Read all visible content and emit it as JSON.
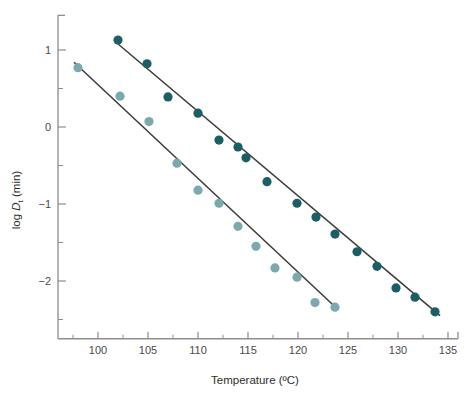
{
  "chart_data": {
    "type": "scatter",
    "title": "",
    "xlabel": "Temperature (ºC)",
    "ylabel": "log Dt (min)",
    "ylabel_parts": {
      "prefix": "log ",
      "italic": "D",
      "subscript": "t",
      "suffix": " (min)"
    },
    "xlim": [
      96,
      136
    ],
    "ylim": [
      -2.75,
      1.45
    ],
    "xticks": [
      100,
      105,
      110,
      115,
      120,
      125,
      130,
      135
    ],
    "xtick_labels": [
      "100",
      "105",
      "110",
      "115",
      "120",
      "125",
      "130",
      "135"
    ],
    "xminor_ticks": [
      97.5,
      102.5,
      107.5,
      112.5,
      117.5,
      122.5,
      127.5,
      132.5
    ],
    "yticks": [
      1,
      0,
      -1,
      -2
    ],
    "ytick_labels": [
      "1",
      "0",
      "−1",
      "−2"
    ],
    "yminor_ticks": [
      1.5,
      0.5,
      -0.5,
      -1.5,
      -2.5
    ],
    "grid": false,
    "legend": "none",
    "series": [
      {
        "name": "upper-series",
        "marker_color": "#1b5f66",
        "line_color": "#3a3a3a",
        "points": [
          {
            "x": 102.0,
            "y": 1.13
          },
          {
            "x": 104.9,
            "y": 0.82
          },
          {
            "x": 107.0,
            "y": 0.39
          },
          {
            "x": 110.0,
            "y": 0.18
          },
          {
            "x": 112.1,
            "y": -0.17
          },
          {
            "x": 114.0,
            "y": -0.26
          },
          {
            "x": 114.8,
            "y": -0.4
          },
          {
            "x": 116.9,
            "y": -0.71
          },
          {
            "x": 119.9,
            "y": -0.99
          },
          {
            "x": 121.8,
            "y": -1.17
          },
          {
            "x": 123.7,
            "y": -1.39
          },
          {
            "x": 125.9,
            "y": -1.62
          },
          {
            "x": 127.9,
            "y": -1.81
          },
          {
            "x": 129.8,
            "y": -2.09
          },
          {
            "x": 131.7,
            "y": -2.21
          },
          {
            "x": 133.7,
            "y": -2.4
          }
        ],
        "fit_line": {
          "x1": 101.8,
          "y1": 1.1,
          "x2": 134.2,
          "y2": -2.45
        }
      },
      {
        "name": "lower-series",
        "marker_color": "#7ca9ae",
        "line_color": "#3a3a3a",
        "points": [
          {
            "x": 98.0,
            "y": 0.77
          },
          {
            "x": 102.2,
            "y": 0.4
          },
          {
            "x": 105.1,
            "y": 0.07
          },
          {
            "x": 107.9,
            "y": -0.47
          },
          {
            "x": 110.0,
            "y": -0.82
          },
          {
            "x": 112.1,
            "y": -0.99
          },
          {
            "x": 114.0,
            "y": -1.29
          },
          {
            "x": 115.8,
            "y": -1.55
          },
          {
            "x": 117.7,
            "y": -1.83
          },
          {
            "x": 119.9,
            "y": -1.95
          },
          {
            "x": 121.7,
            "y": -2.28
          },
          {
            "x": 123.7,
            "y": -2.34
          }
        ],
        "fit_line": {
          "x1": 97.6,
          "y1": 0.84,
          "x2": 124.0,
          "y2": -2.37
        }
      }
    ]
  }
}
